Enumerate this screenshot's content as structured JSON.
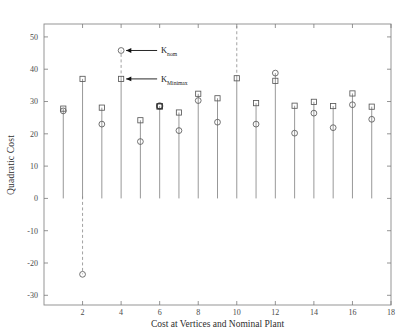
{
  "chart_data": {
    "type": "scatter",
    "title": "",
    "xlabel": "Cost at Vertices and Nominal Plant",
    "ylabel": "Quadratic Cost",
    "xlim": [
      0,
      18
    ],
    "ylim": [
      -33,
      54
    ],
    "xticks": [
      2,
      4,
      6,
      8,
      10,
      12,
      14,
      16,
      18
    ],
    "yticks": [
      50,
      40,
      30,
      20,
      10,
      0,
      -10,
      -20,
      -30
    ],
    "grid": false,
    "legend_position": "none",
    "x": [
      1,
      2,
      3,
      4,
      5,
      6,
      7,
      8,
      9,
      10,
      11,
      12,
      13,
      14,
      15,
      16,
      17
    ],
    "series": [
      {
        "name": "K_Minimax",
        "marker": "square",
        "values": [
          27.8,
          37.0,
          28.1,
          37.0,
          24.2,
          28.5,
          26.6,
          32.4,
          31.0,
          37.2,
          29.5,
          36.4,
          28.7,
          29.9,
          28.6,
          32.5,
          28.4
        ]
      },
      {
        "name": "K_nom",
        "marker": "circle",
        "values": [
          27.1,
          -23.5,
          23.0,
          45.8,
          17.6,
          28.6,
          21.0,
          30.3,
          23.6,
          null,
          23.0,
          38.8,
          20.2,
          26.4,
          21.9,
          29.0,
          24.5
        ]
      }
    ],
    "annotations": [
      {
        "label": "K",
        "subscript": "nom",
        "points_to_x": 4,
        "points_to_y": 45.8
      },
      {
        "label": "K",
        "subscript": "Minimax",
        "points_to_x": 4,
        "points_to_y": 37.0
      }
    ],
    "notes": {
      "dashed_stems_x": [
        2,
        4,
        10
      ],
      "baseline_y": 0
    }
  },
  "axes": {
    "x_tick_labels": [
      "2",
      "4",
      "6",
      "8",
      "10",
      "12",
      "14",
      "16",
      "18"
    ],
    "y_tick_labels": [
      "50",
      "40",
      "30",
      "20",
      "10",
      "0",
      "-10",
      "-20",
      "-30"
    ],
    "x_title": "Cost at Vertices and Nominal Plant",
    "y_title": "Quadratic Cost"
  },
  "annotations": {
    "knom_label": "K",
    "knom_sub": "nom",
    "kminimax_label": "K",
    "kminimax_sub": "Minimax"
  },
  "colors": {
    "axis": "#8a8a8a",
    "stem": "#7d7d7d",
    "marker": "#5a5a5a",
    "text": "#2e2e2e",
    "background": "#ffffff"
  }
}
